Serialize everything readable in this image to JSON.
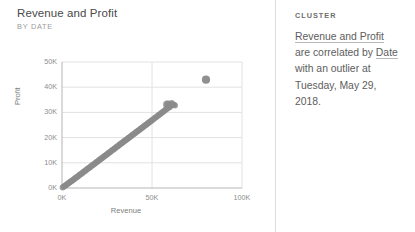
{
  "chart": {
    "title": "Revenue and Profit",
    "subtitle": "BY DATE"
  },
  "insight": {
    "kicker": "CLUSTER",
    "text_part1": "Revenue and Profit",
    "text_part2": " are correlated by ",
    "text_part3": "Date",
    "text_part4": " with an outlier at Tuesday, May 29, 2018.",
    "full_text": "Revenue and Profit are correlated by Date with an outlier at Tuesday, May 29, 2018."
  },
  "colors": {
    "point": "#8a8a8a",
    "grid": "#e2e2e2",
    "axis": "#b5b5b5",
    "divider": "#dcdcdc",
    "text": "#5d5d5d"
  },
  "chart_data": {
    "type": "scatter",
    "title": "Revenue and Profit",
    "subtitle": "BY DATE",
    "xlabel": "Revenue",
    "ylabel": "Profit",
    "xlim": [
      0,
      100000
    ],
    "ylim": [
      0,
      50000
    ],
    "xticks": [
      0,
      50000,
      100000
    ],
    "xticklabels": [
      "0K",
      "50K",
      "100K"
    ],
    "yticks": [
      0,
      10000,
      20000,
      30000,
      40000,
      50000
    ],
    "yticklabels": [
      "0K",
      "10K",
      "20K",
      "30K",
      "40K",
      "50K"
    ],
    "grid": true,
    "legend": false,
    "series": [
      {
        "name": "Revenue vs Profit by Date",
        "marker": "circle",
        "color": "#8a8a8a",
        "points": [
          [
            300,
            150
          ],
          [
            700,
            380
          ],
          [
            1100,
            600
          ],
          [
            1500,
            800
          ],
          [
            1900,
            1000
          ],
          [
            2300,
            1230
          ],
          [
            2700,
            1420
          ],
          [
            3100,
            1650
          ],
          [
            3500,
            1830
          ],
          [
            3900,
            2050
          ],
          [
            4300,
            2260
          ],
          [
            4700,
            2480
          ],
          [
            5100,
            2700
          ],
          [
            5500,
            2880
          ],
          [
            5900,
            3100
          ],
          [
            6300,
            3310
          ],
          [
            6700,
            3520
          ],
          [
            7100,
            3750
          ],
          [
            7500,
            3950
          ],
          [
            7900,
            4160
          ],
          [
            8300,
            4380
          ],
          [
            8700,
            4600
          ],
          [
            9100,
            4800
          ],
          [
            9500,
            5020
          ],
          [
            9900,
            5240
          ],
          [
            10300,
            5450
          ],
          [
            10700,
            5670
          ],
          [
            11100,
            5880
          ],
          [
            11500,
            6100
          ],
          [
            11900,
            6320
          ],
          [
            12300,
            6530
          ],
          [
            12700,
            6750
          ],
          [
            13100,
            6960
          ],
          [
            13500,
            7180
          ],
          [
            13900,
            7400
          ],
          [
            14300,
            7610
          ],
          [
            14700,
            7830
          ],
          [
            15100,
            8040
          ],
          [
            15500,
            8260
          ],
          [
            15900,
            8480
          ],
          [
            16300,
            8690
          ],
          [
            16700,
            8910
          ],
          [
            17100,
            9120
          ],
          [
            17500,
            9340
          ],
          [
            17900,
            9560
          ],
          [
            18300,
            9770
          ],
          [
            18700,
            9990
          ],
          [
            19100,
            10200
          ],
          [
            19500,
            10420
          ],
          [
            19900,
            10640
          ],
          [
            20300,
            10850
          ],
          [
            20700,
            11070
          ],
          [
            21100,
            11280
          ],
          [
            21500,
            11500
          ],
          [
            21900,
            11720
          ],
          [
            22300,
            11930
          ],
          [
            22700,
            12150
          ],
          [
            23100,
            12360
          ],
          [
            23500,
            12580
          ],
          [
            23900,
            12800
          ],
          [
            24300,
            13010
          ],
          [
            24700,
            13230
          ],
          [
            25100,
            13440
          ],
          [
            25500,
            13660
          ],
          [
            25900,
            13880
          ],
          [
            26300,
            14090
          ],
          [
            26700,
            14310
          ],
          [
            27100,
            14520
          ],
          [
            27500,
            14740
          ],
          [
            27900,
            14960
          ],
          [
            28300,
            15170
          ],
          [
            28700,
            15390
          ],
          [
            29100,
            15600
          ],
          [
            29500,
            15820
          ],
          [
            29900,
            16040
          ],
          [
            30300,
            16250
          ],
          [
            30700,
            16470
          ],
          [
            31100,
            16680
          ],
          [
            31500,
            16900
          ],
          [
            31900,
            17120
          ],
          [
            32300,
            17330
          ],
          [
            32700,
            17550
          ],
          [
            33100,
            17760
          ],
          [
            33500,
            17980
          ],
          [
            33900,
            18200
          ],
          [
            34300,
            18410
          ],
          [
            34700,
            18630
          ],
          [
            35100,
            18840
          ],
          [
            35500,
            19060
          ],
          [
            35900,
            19280
          ],
          [
            36300,
            19490
          ],
          [
            36700,
            19710
          ],
          [
            37100,
            19920
          ],
          [
            37500,
            20140
          ],
          [
            37900,
            20360
          ],
          [
            38300,
            20570
          ],
          [
            38700,
            20790
          ],
          [
            39100,
            21000
          ],
          [
            39500,
            21220
          ],
          [
            39900,
            21440
          ],
          [
            40300,
            21650
          ],
          [
            40700,
            21870
          ],
          [
            41100,
            22080
          ],
          [
            41500,
            22300
          ],
          [
            41900,
            22520
          ],
          [
            42300,
            22730
          ],
          [
            42700,
            22950
          ],
          [
            43100,
            23160
          ],
          [
            43500,
            23380
          ],
          [
            43900,
            23600
          ],
          [
            44300,
            23810
          ],
          [
            44700,
            24030
          ],
          [
            45100,
            24240
          ],
          [
            45500,
            24460
          ],
          [
            45900,
            24680
          ],
          [
            46300,
            24890
          ],
          [
            46700,
            25110
          ],
          [
            47100,
            25320
          ],
          [
            47500,
            25540
          ],
          [
            47900,
            25760
          ],
          [
            48300,
            25970
          ],
          [
            48700,
            26190
          ],
          [
            49100,
            26400
          ],
          [
            49500,
            26620
          ],
          [
            49900,
            26840
          ],
          [
            50400,
            27100
          ],
          [
            50900,
            27380
          ],
          [
            51400,
            27650
          ],
          [
            51900,
            27930
          ],
          [
            52400,
            28200
          ],
          [
            52900,
            28480
          ],
          [
            53400,
            28750
          ],
          [
            53900,
            29030
          ],
          [
            54400,
            29300
          ],
          [
            54900,
            29580
          ],
          [
            55400,
            29850
          ],
          [
            55900,
            30130
          ],
          [
            56400,
            30400
          ],
          [
            56900,
            30680
          ],
          [
            57400,
            30950
          ],
          [
            57900,
            31230
          ],
          [
            58300,
            31450
          ],
          [
            58700,
            31700
          ],
          [
            59100,
            31900
          ],
          [
            59600,
            32100
          ],
          [
            60000,
            32400
          ],
          [
            60400,
            32600
          ],
          [
            60800,
            32800
          ],
          [
            61200,
            32950
          ],
          [
            61600,
            33050
          ],
          [
            62000,
            33150
          ],
          [
            62400,
            32900
          ],
          [
            62800,
            32700
          ],
          [
            59000,
            33400
          ],
          [
            58500,
            33600
          ],
          [
            57800,
            33300
          ],
          [
            60500,
            33500
          ],
          [
            61000,
            33700
          ],
          [
            58000,
            32500
          ],
          [
            59800,
            32000
          ]
        ]
      },
      {
        "name": "Outlier",
        "marker": "circle",
        "color": "#8a8a8a",
        "points": [
          [
            80000,
            43000
          ]
        ],
        "annotation": "Tuesday, May 29, 2018"
      }
    ]
  }
}
